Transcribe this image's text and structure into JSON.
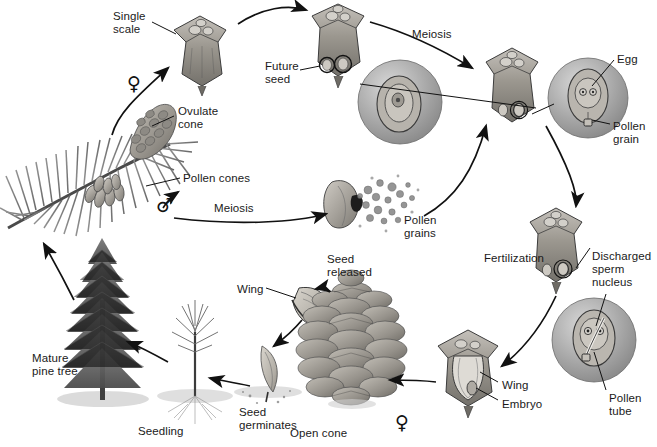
{
  "figure": {
    "background": "#ffffff",
    "ink_color": "#1a1a1a",
    "art_gray_mid": "#9a9a9a",
    "art_gray_dark": "#6b6b6b",
    "art_gray_light": "#c9c9c9"
  },
  "labels": [
    {
      "id": "single-scale",
      "text": "Single\nscale",
      "x": 113,
      "y": 10,
      "align": "left"
    },
    {
      "id": "future-seed",
      "text": "Future\nseed",
      "x": 265,
      "y": 60,
      "align": "left"
    },
    {
      "id": "meiosis-top",
      "text": "Meiosis",
      "x": 412,
      "y": 28,
      "align": "left"
    },
    {
      "id": "egg",
      "text": "Egg",
      "x": 617,
      "y": 53,
      "align": "left"
    },
    {
      "id": "pollen-grain",
      "text": "Pollen\ngrain",
      "x": 613,
      "y": 120,
      "align": "left"
    },
    {
      "id": "ovulate-cone",
      "text": "Ovulate\ncone",
      "x": 178,
      "y": 105,
      "align": "left"
    },
    {
      "id": "pollen-cones",
      "text": "Pollen cones",
      "x": 183,
      "y": 172,
      "align": "left"
    },
    {
      "id": "meiosis-bottom",
      "text": "Meiosis",
      "x": 214,
      "y": 202,
      "align": "left"
    },
    {
      "id": "pollen-grains",
      "text": "Pollen\ngrains",
      "x": 404,
      "y": 214,
      "align": "left"
    },
    {
      "id": "fertilization",
      "text": "Fertilization",
      "x": 484,
      "y": 252,
      "align": "left"
    },
    {
      "id": "discharged-sperm",
      "text": "Discharged\nsperm\nnucleus",
      "x": 592,
      "y": 250,
      "align": "left"
    },
    {
      "id": "pollen-tube",
      "text": "Pollen\ntube",
      "x": 609,
      "y": 392,
      "align": "left"
    },
    {
      "id": "wing-embryo-wing",
      "text": "Wing",
      "x": 502,
      "y": 379,
      "align": "left"
    },
    {
      "id": "embryo",
      "text": "Embryo",
      "x": 502,
      "y": 398,
      "align": "left"
    },
    {
      "id": "seed-released",
      "text": "Seed\nreleased",
      "x": 327,
      "y": 253,
      "align": "left"
    },
    {
      "id": "open-cone",
      "text": "Open cone",
      "x": 290,
      "y": 427,
      "align": "left"
    },
    {
      "id": "wing-seed",
      "text": "Wing",
      "x": 237,
      "y": 283,
      "align": "left"
    },
    {
      "id": "seed-germinates",
      "text": "Seed\ngerminates",
      "x": 239,
      "y": 406,
      "align": "left"
    },
    {
      "id": "seedling",
      "text": "Seedling",
      "x": 138,
      "y": 425,
      "align": "left"
    },
    {
      "id": "mature-pine-tree",
      "text": "Mature\npine tree",
      "x": 32,
      "y": 352,
      "align": "left"
    }
  ],
  "symbols": [
    {
      "id": "female-ovulate",
      "glyph": "♀",
      "x": 127,
      "y": 74
    },
    {
      "id": "male-pollen",
      "glyph": "♂",
      "x": 156,
      "y": 196
    },
    {
      "id": "female-cone",
      "glyph": "♀",
      "x": 395,
      "y": 413
    }
  ],
  "stages": [
    {
      "id": "branch-with-cones",
      "name": "Pine branch with ovulate and pollen cones"
    },
    {
      "id": "single-scale",
      "name": "Single ovulate scale"
    },
    {
      "id": "ovule-megaspore",
      "name": "Ovule with megasporocyte (future seed)"
    },
    {
      "id": "pollen-sac",
      "name": "Pollen sac releasing pollen grains"
    },
    {
      "id": "scale-with-ovules",
      "name": "Scale with ovules, pollination"
    },
    {
      "id": "ovule-egg",
      "name": "Ovule close-up with egg and pollen grain"
    },
    {
      "id": "scale-fertilization",
      "name": "Scale at fertilization"
    },
    {
      "id": "ovule-pollen-tube",
      "name": "Ovule with pollen tube and discharged sperm nucleus"
    },
    {
      "id": "seed-in-scale",
      "name": "Seed in scale with wing and embryo"
    },
    {
      "id": "open-cone",
      "name": "Open mature cone releasing seeds"
    },
    {
      "id": "winged-seed",
      "name": "Winged seed"
    },
    {
      "id": "seed-germinating",
      "name": "Seed germinating in soil"
    },
    {
      "id": "seedling",
      "name": "Pine seedling"
    },
    {
      "id": "mature-tree",
      "name": "Mature pine tree"
    }
  ]
}
